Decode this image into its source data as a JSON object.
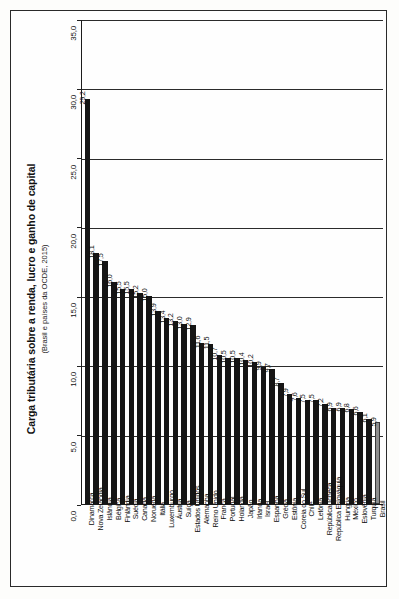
{
  "chart_data": {
    "type": "bar",
    "title": "Carga tributária sobre a renda, lucro e ganho de capital",
    "subtitle": "(Brasil e países da OCDE, 2015)",
    "xlabel": "",
    "ylabel": "",
    "ylim": [
      0.0,
      35.0
    ],
    "yticks": [
      "0,0",
      "5,0",
      "10,0",
      "15,0",
      "20,0",
      "25,0",
      "30,0",
      "35,0"
    ],
    "ytick_values": [
      0.0,
      5.0,
      10.0,
      15.0,
      20.0,
      25.0,
      30.0,
      35.0
    ],
    "grid": "horizontal",
    "legend": "none",
    "categories": [
      "Dinamarca",
      "Nova Zelândia",
      "Islândia",
      "Bélgica",
      "Finlândia",
      "Suécia",
      "Canadá",
      "Noruega",
      "Itália",
      "Luxemburgo",
      "Áustria",
      "Suíça",
      "Estados Unidos",
      "Alemanha",
      "Reino Unido",
      "França",
      "Portugal",
      "Holanda",
      "Japão",
      "Irlanda",
      "Israel",
      "Espanha",
      "Grécia",
      "Estônia",
      "Coreia do Sul",
      "Chile",
      "Letônia",
      "República Tcheca",
      "República Eslováquia",
      "Hungria",
      "México",
      "Eslovênia",
      "Turquia",
      "Brasil"
    ],
    "values": [
      29.2,
      18.1,
      17.5,
      16.0,
      15.5,
      15.5,
      15.2,
      15.0,
      13.9,
      13.4,
      13.2,
      13.0,
      12.9,
      11.6,
      11.5,
      10.7,
      10.5,
      10.5,
      10.4,
      10.2,
      9.9,
      9.7,
      8.7,
      7.9,
      7.6,
      7.5,
      7.5,
      7.2,
      6.9,
      6.9,
      6.8,
      6.6,
      6.1,
      5.9
    ],
    "value_labels": [
      "29,2",
      "18,1",
      "17,5",
      "16,0",
      "15,5",
      "15,5",
      "15,2",
      "15,0",
      "13,9",
      "13,4",
      "13,2",
      "13,0",
      "12,9",
      "11,6",
      "11,5",
      "10,7",
      "10,5",
      "10,5",
      "10,4",
      "10,2",
      "9,9",
      "9,7",
      "8,7",
      "7,9",
      "7,6",
      "7,5",
      "7,5",
      "7,2",
      "6,9",
      "6,9",
      "6,8",
      "6,6",
      "6,1",
      "5,9"
    ],
    "highlight_category": "Brasil",
    "colors": {
      "bar": "#151515",
      "highlight_bar": "#8e8e8e",
      "axis": "#1c1c1c",
      "grid": "#2b2b2b",
      "text": "#0c0c0c",
      "frame": "#2a2a2a",
      "background": "#fefefe"
    }
  }
}
